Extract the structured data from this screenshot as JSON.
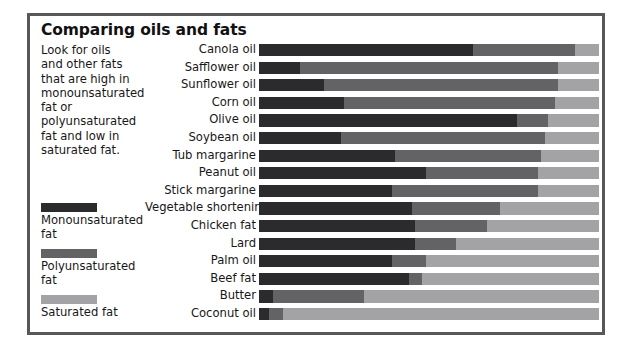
{
  "title": "Comparing oils and fats",
  "intro_text": "Look for oils and other fats that are high in monounsaturated fat or polyunsaturated fat and low in saturated fat.",
  "legend": [
    {
      "label": "Monounsaturated fat",
      "color": "#2b2b2d",
      "key": "mono"
    },
    {
      "label": "Polyunsaturated fat",
      "color": "#636366",
      "key": "poly"
    },
    {
      "label": "Saturated fat",
      "color": "#a3a3a5",
      "key": "sat"
    }
  ],
  "chart_data": {
    "type": "bar",
    "title": "Comparing oils and fats",
    "xlabel": "",
    "ylabel": "",
    "orientation": "horizontal",
    "stacked": true,
    "normalized": true,
    "xlim": [
      0,
      100
    ],
    "grid": false,
    "legend_position": "left",
    "categories": [
      "Canola oil",
      "Safflower oil",
      "Sunflower oil",
      "Corn oil",
      "Olive oil",
      "Soybean oil",
      "Tub margarine",
      "Peanut oil",
      "Stick margarine",
      "Vegetable shortening",
      "Chicken fat",
      "Lard",
      "Palm oil",
      "Beef fat",
      "Butter",
      "Coconut oil"
    ],
    "series": [
      {
        "name": "Monounsaturated fat",
        "color": "#2b2b2d",
        "values": [
          63,
          12,
          19,
          25,
          76,
          24,
          40,
          49,
          39,
          45,
          46,
          46,
          39,
          44,
          4,
          3
        ]
      },
      {
        "name": "Polyunsaturated fat",
        "color": "#636366",
        "values": [
          30,
          76,
          69,
          62,
          9,
          60,
          43,
          33,
          43,
          26,
          21,
          12,
          10,
          4,
          27,
          4
        ]
      },
      {
        "name": "Saturated fat",
        "color": "#a3a3a5",
        "values": [
          7,
          12,
          12,
          13,
          15,
          16,
          17,
          18,
          18,
          29,
          33,
          42,
          51,
          52,
          69,
          93
        ]
      }
    ]
  }
}
